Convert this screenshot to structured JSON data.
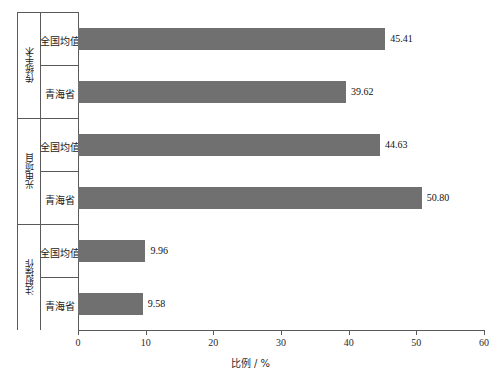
{
  "chart_data": {
    "type": "bar",
    "orientation": "horizontal",
    "title": "",
    "xlabel": "比例 / %",
    "ylabel": "",
    "xlim": [
      0,
      60
    ],
    "xticks": [
      0,
      10,
      20,
      30,
      40,
      50,
      60
    ],
    "xtick_labels": [
      "0",
      "10",
      "20",
      "30",
      "40",
      "50",
      "60"
    ],
    "grid": false,
    "legend": false,
    "bar_color": "#707070",
    "axis_color": "#595959",
    "groups": [
      {
        "label": "传统手术",
        "items": [
          {
            "label": "全国均值",
            "value": 45.41,
            "value_label": "45.41"
          },
          {
            "label": "青海省",
            "value": 39.62,
            "value_label": "39.62"
          }
        ]
      },
      {
        "label": "光电项目",
        "items": [
          {
            "label": "全国均值",
            "value": 44.63,
            "value_label": "44.63"
          },
          {
            "label": "青海省",
            "value": 50.8,
            "value_label": "50.80"
          }
        ]
      },
      {
        "label": "注射操作",
        "items": [
          {
            "label": "全国均值",
            "value": 9.96,
            "value_label": "9.96"
          },
          {
            "label": "青海省",
            "value": 9.58,
            "value_label": "9.58"
          }
        ]
      }
    ],
    "categories": [
      "传统手术 / 全国均值",
      "传统手术 / 青海省",
      "光电项目 / 全国均值",
      "光电项目 / 青海省",
      "注射操作 / 全国均值",
      "注射操作 / 青海省"
    ],
    "values": [
      45.41,
      39.62,
      44.63,
      50.8,
      9.96,
      9.58
    ]
  }
}
